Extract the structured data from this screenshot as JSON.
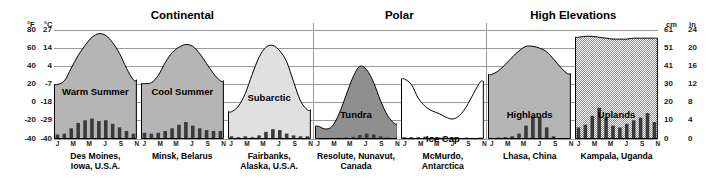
{
  "axes": {
    "left": {
      "unit_primary": "°F",
      "unit_secondary": "°C",
      "f_ticks": [
        "80",
        "60",
        "40",
        "20",
        "0",
        "-20",
        "-40"
      ],
      "c_ticks": [
        "27",
        "14",
        "4",
        "-7",
        "-18",
        "-29",
        "-40"
      ]
    },
    "right": {
      "unit_primary": "cm",
      "unit_secondary": "in",
      "cm_ticks": [
        "61",
        "51",
        "41",
        "30",
        "20",
        "10",
        "0"
      ],
      "in_ticks": [
        "24",
        "20",
        "16",
        "12",
        "8",
        "4",
        "0"
      ]
    },
    "month_ticks": [
      "J",
      "M",
      "M",
      "J",
      "S",
      "N"
    ]
  },
  "groups": [
    {
      "label": "Continental"
    },
    {
      "label": "Polar"
    },
    {
      "label": "High Elevations"
    }
  ],
  "colors": {
    "temp_fill_dark": "#8f8f8f",
    "temp_fill_mid": "#b5b5b5",
    "temp_fill_light": "#d8d8d8",
    "temp_fill_white": "#ffffff",
    "precip_bar": "#3a3a3a",
    "gridline": "#9a9a9a",
    "outline": "#000000"
  },
  "chart_data": {
    "type": "line",
    "ylabel_left": "Temperature (°F / °C)",
    "ylabel_right": "Precipitation (cm / in)",
    "xlabel": "Month",
    "grid": true,
    "legend": "none",
    "ylim_f": [
      -40,
      80
    ],
    "ylim_cm": [
      0,
      61
    ],
    "panels": [
      {
        "group": "Continental",
        "climate": "Warm Summer",
        "city": "Des Moines,\nIowa, U.S.A.",
        "fill": "#b5b5b5",
        "temp_f": [
          20,
          24,
          38,
          52,
          63,
          72,
          76,
          74,
          66,
          54,
          38,
          25
        ],
        "precip_cm": [
          2.5,
          3.0,
          6.0,
          9.0,
          10.5,
          11.5,
          10.0,
          10.5,
          8.5,
          6.5,
          4.5,
          3.0
        ]
      },
      {
        "group": "Continental",
        "climate": "Cool Summer",
        "city": "Minsk, Belarus",
        "fill": "#b5b5b5",
        "temp_f": [
          21,
          22,
          30,
          44,
          55,
          61,
          64,
          62,
          54,
          43,
          32,
          24
        ],
        "precip_cm": [
          3.5,
          3.0,
          3.5,
          4.5,
          6.0,
          8.0,
          9.5,
          7.5,
          6.0,
          5.0,
          4.5,
          4.5
        ]
      },
      {
        "group": "Continental",
        "climate": "Subarctic",
        "city": "Fairbanks,\nAlaska, U.S.A.",
        "fill": "#e0e0e0",
        "temp_f": [
          -10,
          -4,
          10,
          31,
          50,
          61,
          63,
          57,
          45,
          23,
          2,
          -8
        ],
        "precip_cm": [
          1.5,
          1.0,
          1.5,
          1.0,
          2.0,
          4.0,
          5.5,
          5.0,
          3.0,
          2.0,
          1.5,
          1.5
        ]
      },
      {
        "group": "Polar",
        "climate": "Tundra",
        "city": "Resolute, Nunavut,\nCanada",
        "fill": "#8f8f8f",
        "temp_f": [
          -26,
          -29,
          -26,
          -12,
          8,
          28,
          40,
          36,
          22,
          2,
          -14,
          -23
        ],
        "precip_cm": [
          0.5,
          0.4,
          0.6,
          0.7,
          0.8,
          1.2,
          2.2,
          3.0,
          2.5,
          1.5,
          0.8,
          0.5
        ]
      },
      {
        "group": "Polar",
        "climate": "Ice Cap",
        "city": "McMurdo,\nAntarctica",
        "fill": "#ffffff",
        "temp_f": [
          26,
          20,
          5,
          -4,
          -9,
          -12,
          -16,
          -18,
          -14,
          -4,
          10,
          23
        ],
        "precip_cm": [
          1.0,
          1.0,
          1.0,
          1.3,
          1.0,
          0.8,
          0.8,
          0.8,
          0.6,
          0.8,
          0.6,
          0.8
        ]
      },
      {
        "group": "High Elevations",
        "climate": "Highlands",
        "city": "Lhasa, China",
        "fill": "#b5b5b5",
        "temp_f": [
          31,
          35,
          42,
          50,
          57,
          62,
          62,
          60,
          56,
          48,
          39,
          32
        ],
        "precip_cm": [
          0.5,
          0.8,
          1.0,
          1.5,
          3.0,
          7.5,
          12.5,
          12.5,
          6.5,
          1.5,
          0.4,
          0.3
        ]
      },
      {
        "group": "High Elevations",
        "climate": "Uplands",
        "city": "Kampala, Uganda",
        "fill": "#cfcfcf",
        "temp_f": [
          72,
          73,
          73,
          72,
          71,
          70,
          70,
          70,
          71,
          71,
          71,
          71
        ],
        "precip_cm": [
          6.5,
          8.0,
          13.0,
          17.5,
          12.0,
          7.5,
          6.5,
          8.5,
          10.5,
          12.0,
          14.5,
          9.5
        ]
      }
    ]
  }
}
